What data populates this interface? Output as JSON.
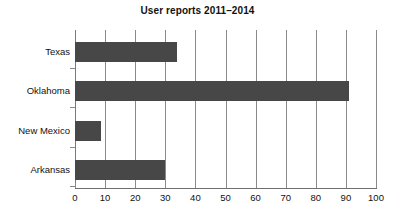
{
  "chart_data": {
    "type": "bar",
    "orientation": "horizontal",
    "title": "User reports 2011–2014",
    "xlabel": "",
    "ylabel": "",
    "categories": [
      "Texas",
      "Oklahoma",
      "New Mexico",
      "Arkansas"
    ],
    "values": [
      34,
      91,
      8.5,
      30
    ],
    "xlim": [
      0,
      100
    ],
    "xticks": [
      0,
      10,
      20,
      30,
      40,
      50,
      60,
      70,
      80,
      90,
      100
    ],
    "xtick_labels": [
      "0",
      "10",
      "20",
      "30",
      "40",
      "50",
      "60",
      "70",
      "80",
      "90",
      "100"
    ],
    "grid": "vertical",
    "legend": "none",
    "bar_color": "#474747",
    "grid_color": "#8a8a8a",
    "axis_color": "#6f6f6f",
    "text_color": "#111111",
    "background": "#ffffff"
  }
}
